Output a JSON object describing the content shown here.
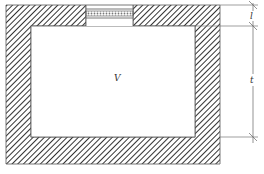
{
  "diagram": {
    "labels": {
      "volume": "V",
      "neck_length": "l",
      "wall_thickness": "t"
    },
    "colors": {
      "stroke": "#555555",
      "hatch": "#333333",
      "background": "#ffffff"
    },
    "geometry": {
      "outer": {
        "x": 6,
        "y": 5,
        "w": 214,
        "h": 159
      },
      "inner": {
        "x": 31,
        "y": 26,
        "w": 164,
        "h": 111
      },
      "opening": {
        "x": 86,
        "y": 5,
        "w": 47,
        "h": 21
      },
      "dimension_line_x": 253,
      "dimension_ticks_y": [
        5,
        26,
        137
      ]
    }
  }
}
